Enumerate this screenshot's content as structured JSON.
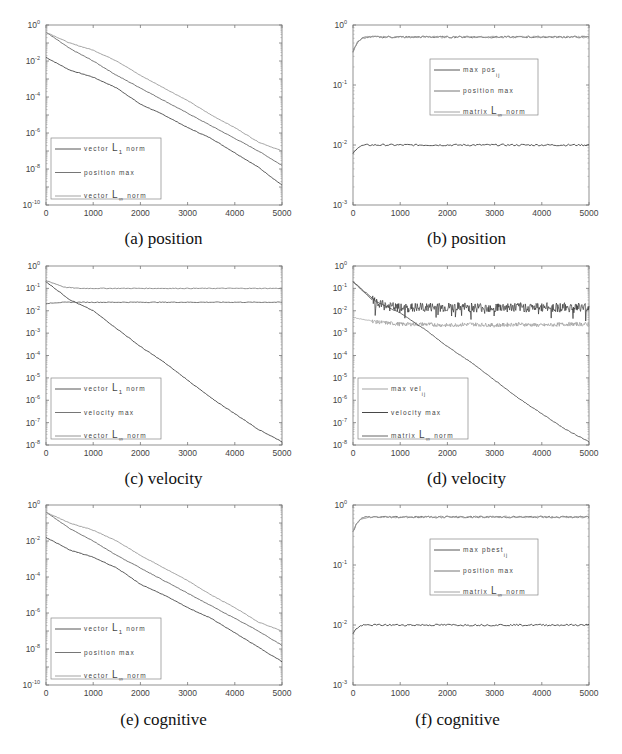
{
  "chart_data": [
    {
      "id": "a",
      "type": "line",
      "caption": "(a) position",
      "yscale": "log",
      "xlim": [
        0,
        5000
      ],
      "ylim_exp": [
        -10,
        0
      ],
      "xticks": [
        0,
        1000,
        2000,
        3000,
        4000,
        5000
      ],
      "yticks_exp": [
        0,
        -2,
        -4,
        -6,
        -8,
        -10
      ],
      "legend": {
        "position": "lower-left",
        "entries": [
          "vector L1 norm",
          "position max",
          "vector L∞ norm"
        ]
      },
      "series": [
        {
          "name": "vector L1 norm",
          "color": "#444444",
          "x": [
            0,
            500,
            1000,
            1500,
            2000,
            2500,
            3000,
            3500,
            4000,
            4500,
            5000
          ],
          "log10y": [
            -1.8,
            -2.5,
            -2.9,
            -3.5,
            -4.4,
            -5.0,
            -5.7,
            -6.3,
            -7.1,
            -7.9,
            -8.9
          ]
        },
        {
          "name": "position max",
          "color": "#666666",
          "x": [
            0,
            500,
            1000,
            1500,
            2000,
            2500,
            3000,
            3500,
            4000,
            4500,
            5000
          ],
          "log10y": [
            -0.4,
            -1.3,
            -2.0,
            -2.8,
            -3.5,
            -4.2,
            -4.9,
            -5.6,
            -6.3,
            -7.0,
            -7.8
          ]
        },
        {
          "name": "vector L∞ norm",
          "color": "#999999",
          "x": [
            0,
            500,
            1000,
            1500,
            2000,
            2500,
            3000,
            3500,
            4000,
            4500,
            5000
          ],
          "log10y": [
            -0.4,
            -1.0,
            -1.4,
            -2.0,
            -2.8,
            -3.5,
            -4.2,
            -5.0,
            -5.7,
            -6.5,
            -7.0
          ]
        }
      ]
    },
    {
      "id": "b",
      "type": "line",
      "caption": "(b) position",
      "yscale": "log",
      "xlim": [
        0,
        5000
      ],
      "ylim_exp": [
        -3,
        0
      ],
      "xticks": [
        0,
        1000,
        2000,
        3000,
        4000,
        5000
      ],
      "yticks_exp": [
        0,
        -1,
        -2,
        -3
      ],
      "legend": {
        "position": "center",
        "entries": [
          "max pos_ij",
          "position max",
          "matrix L∞ norm"
        ]
      },
      "series": [
        {
          "name": "max pos_ij",
          "color": "#444444",
          "x": [
            0,
            50,
            100,
            200,
            300,
            5000
          ],
          "log10y": [
            -2.15,
            -2.08,
            -2.04,
            -2.01,
            -2.0,
            -2.0
          ]
        },
        {
          "name": "position max",
          "color": "#666666",
          "x": [
            0,
            50,
            100,
            200,
            300,
            5000
          ],
          "log10y": [
            -0.45,
            -0.35,
            -0.28,
            -0.22,
            -0.2,
            -0.2
          ]
        },
        {
          "name": "matrix L∞ norm",
          "color": "#999999",
          "x": [
            0,
            50,
            100,
            200,
            300,
            5000
          ],
          "log10y": [
            -0.45,
            -0.35,
            -0.28,
            -0.22,
            -0.2,
            -0.2
          ]
        }
      ]
    },
    {
      "id": "c",
      "type": "line",
      "caption": "(c) velocity",
      "yscale": "log",
      "xlim": [
        0,
        5000
      ],
      "ylim_exp": [
        -8,
        0
      ],
      "xticks": [
        0,
        1000,
        2000,
        3000,
        4000,
        5000
      ],
      "yticks_exp": [
        0,
        -1,
        -2,
        -3,
        -4,
        -5,
        -6,
        -7,
        -8
      ],
      "legend": {
        "position": "lower-left",
        "entries": [
          "vector L1 norm",
          "velocity max",
          "vector L∞ norm"
        ]
      },
      "series": [
        {
          "name": "vector L1 norm",
          "color": "#444444",
          "x": [
            0,
            500,
            1000,
            1500,
            2000,
            2500,
            3000,
            3500,
            4000,
            4500,
            5000
          ],
          "log10y": [
            -0.7,
            -1.5,
            -2.0,
            -2.8,
            -3.6,
            -4.3,
            -5.1,
            -5.9,
            -6.6,
            -7.3,
            -7.85
          ]
        },
        {
          "name": "velocity max",
          "color": "#666666",
          "x": [
            0,
            100,
            300,
            500,
            800,
            5000
          ],
          "log10y": [
            -1.7,
            -1.65,
            -1.63,
            -1.62,
            -1.62,
            -1.62
          ]
        },
        {
          "name": "vector L∞ norm",
          "color": "#888888",
          "x": [
            0,
            200,
            400,
            700,
            1000,
            5000
          ],
          "log10y": [
            -0.65,
            -0.8,
            -0.95,
            -1.0,
            -1.0,
            -1.0
          ]
        }
      ]
    },
    {
      "id": "d",
      "type": "line",
      "caption": "(d) velocity",
      "yscale": "log",
      "xlim": [
        0,
        5000
      ],
      "ylim_exp": [
        -8,
        0
      ],
      "xticks": [
        0,
        1000,
        2000,
        3000,
        4000,
        5000
      ],
      "yticks_exp": [
        0,
        -1,
        -2,
        -3,
        -4,
        -5,
        -6,
        -7,
        -8
      ],
      "legend": {
        "position": "lower-left",
        "entries": [
          "max vel_ij",
          "velocity max",
          "matrix L∞ norm"
        ]
      },
      "series": [
        {
          "name": "max vel_ij",
          "color": "#999999",
          "x": [
            0,
            500,
            1000,
            1500,
            2000,
            2500,
            3000,
            3500,
            4000,
            4500,
            5000
          ],
          "log10y": [
            -2.3,
            -2.5,
            -2.6,
            -2.6,
            -2.65,
            -2.6,
            -2.65,
            -2.6,
            -2.65,
            -2.6,
            -2.6
          ],
          "noisy": true
        },
        {
          "name": "velocity max",
          "color": "#333333",
          "x": [
            0,
            500,
            1000,
            1500,
            2000,
            2500,
            3000,
            3500,
            4000,
            4500,
            5000
          ],
          "log10y": [
            -0.7,
            -1.7,
            -1.9,
            -1.85,
            -1.85,
            -1.85,
            -1.85,
            -1.85,
            -1.85,
            -1.85,
            -1.85
          ],
          "noisy": true
        },
        {
          "name": "matrix L∞ norm",
          "color": "#555555",
          "x": [
            0,
            500,
            1000,
            1500,
            2000,
            2500,
            3000,
            3500,
            4000,
            4500,
            5000
          ],
          "log10y": [
            -0.7,
            -1.6,
            -2.1,
            -2.8,
            -3.6,
            -4.3,
            -5.1,
            -5.9,
            -6.6,
            -7.3,
            -7.85
          ]
        }
      ]
    },
    {
      "id": "e",
      "type": "line",
      "caption": "(e) cognitive",
      "yscale": "log",
      "xlim": [
        0,
        5000
      ],
      "ylim_exp": [
        -10,
        0
      ],
      "xticks": [
        0,
        1000,
        2000,
        3000,
        4000,
        5000
      ],
      "yticks_exp": [
        0,
        -2,
        -4,
        -6,
        -8,
        -10
      ],
      "legend": {
        "position": "lower-left",
        "entries": [
          "vector L1 norm",
          "position max",
          "vector L∞ norm"
        ]
      },
      "series": [
        {
          "name": "vector L1 norm",
          "color": "#444444",
          "x": [
            0,
            500,
            1000,
            1500,
            2000,
            2500,
            3000,
            3500,
            4000,
            4500,
            5000
          ],
          "log10y": [
            -1.8,
            -2.5,
            -2.9,
            -3.5,
            -4.4,
            -5.0,
            -5.7,
            -6.3,
            -7.1,
            -7.9,
            -8.7
          ]
        },
        {
          "name": "position max",
          "color": "#666666",
          "x": [
            0,
            500,
            1000,
            1500,
            2000,
            2500,
            3000,
            3500,
            4000,
            4500,
            5000
          ],
          "log10y": [
            -0.4,
            -1.3,
            -2.0,
            -2.8,
            -3.5,
            -4.2,
            -4.9,
            -5.6,
            -6.3,
            -7.0,
            -7.8
          ]
        },
        {
          "name": "vector L∞ norm",
          "color": "#999999",
          "x": [
            0,
            500,
            1000,
            1500,
            2000,
            2500,
            3000,
            3500,
            4000,
            4500,
            5000
          ],
          "log10y": [
            -0.4,
            -1.0,
            -1.4,
            -2.0,
            -2.8,
            -3.5,
            -4.2,
            -5.0,
            -5.7,
            -6.5,
            -7.0
          ]
        }
      ]
    },
    {
      "id": "f",
      "type": "line",
      "caption": "(f) cognitive",
      "yscale": "log",
      "xlim": [
        0,
        5000
      ],
      "ylim_exp": [
        -3,
        0
      ],
      "xticks": [
        0,
        1000,
        2000,
        3000,
        4000,
        5000
      ],
      "yticks_exp": [
        0,
        -1,
        -2,
        -3
      ],
      "legend": {
        "position": "center",
        "entries": [
          "max pbest_ij",
          "position max",
          "matrix L∞ norm"
        ]
      },
      "series": [
        {
          "name": "max pbest_ij",
          "color": "#444444",
          "x": [
            0,
            50,
            100,
            200,
            300,
            5000
          ],
          "log10y": [
            -2.15,
            -2.08,
            -2.04,
            -2.01,
            -2.0,
            -2.0
          ]
        },
        {
          "name": "position max",
          "color": "#666666",
          "x": [
            0,
            50,
            100,
            200,
            300,
            5000
          ],
          "log10y": [
            -0.45,
            -0.35,
            -0.28,
            -0.22,
            -0.2,
            -0.2
          ]
        },
        {
          "name": "matrix L∞ norm",
          "color": "#999999",
          "x": [
            0,
            50,
            100,
            200,
            300,
            5000
          ],
          "log10y": [
            -0.45,
            -0.35,
            -0.28,
            -0.22,
            -0.2,
            -0.2
          ]
        }
      ]
    }
  ],
  "captions": {
    "a": "(a) position",
    "b": "(b) position",
    "c": "(c) velocity",
    "d": "(d) velocity",
    "e": "(e) cognitive",
    "f": "(f) cognitive"
  }
}
